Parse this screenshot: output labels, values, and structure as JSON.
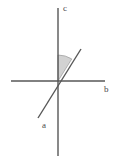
{
  "figure": {
    "background_color": "#ffffff",
    "width": 119,
    "height": 160
  },
  "labels": {
    "vertical_axis": "c",
    "horizontal_axis": "b",
    "diagonal_line": "a"
  },
  "colors": {
    "line_stroke": "#575757",
    "label_text": "#4a4a4a",
    "angle_fill": "#d2d2d2",
    "angle_stroke": "#9a9a9a"
  },
  "chart_data": {
    "type": "diagram",
    "origin": {
      "x": 58,
      "y": 81
    },
    "lines": [
      {
        "name": "c",
        "role": "vertical-axis",
        "x1": 58,
        "y1": 8,
        "x2": 58,
        "y2": 156,
        "angle_deg": 90
      },
      {
        "name": "b",
        "role": "horizontal-axis",
        "x1": 11,
        "y1": 81,
        "x2": 105,
        "y2": 81,
        "angle_deg": 0
      },
      {
        "name": "a",
        "role": "oblique-line",
        "x1": 38,
        "y1": 118,
        "x2": 81,
        "y2": 49,
        "angle_deg": 58
      }
    ],
    "angle_marker": {
      "between": [
        "c",
        "a"
      ],
      "radius": 26,
      "start_deg": 58,
      "end_deg": 90,
      "filled": true
    },
    "label_positions": [
      {
        "text": "c",
        "x": 63,
        "y": 11
      },
      {
        "text": "b",
        "x": 104,
        "y": 92
      },
      {
        "text": "a",
        "x": 42,
        "y": 128
      }
    ]
  }
}
